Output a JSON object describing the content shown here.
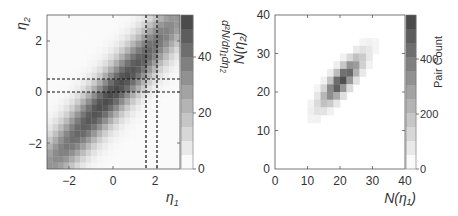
{
  "chart_data": [
    {
      "type": "heatmap",
      "title": "",
      "xlabel": "η1",
      "ylabel": "η2",
      "xlim": [
        -3,
        3
      ],
      "ylim": [
        -3,
        3
      ],
      "xticks": [
        -2,
        0,
        2
      ],
      "yticks": [
        -2,
        0,
        2
      ],
      "grid": false,
      "description": "Diagonal band of high density along η2 ≈ η1, darkest near center, fading away from the diagonal.",
      "reference_lines": {
        "vertical": [
          1.5,
          2.0
        ],
        "horizontal": [
          0.0,
          0.5
        ],
        "style": "dashed"
      },
      "colorbar": {
        "label": "d²N/dη1dη2",
        "range": [
          0,
          55
        ],
        "ticks": [
          0,
          20,
          40
        ]
      }
    },
    {
      "type": "heatmap",
      "title": "",
      "xlabel": "N(η1)",
      "ylabel": "N(η2)",
      "xlim": [
        0,
        40
      ],
      "ylim": [
        0,
        40
      ],
      "xticks": [
        0,
        10,
        20,
        30,
        40
      ],
      "yticks": [
        0,
        10,
        20,
        30,
        40
      ],
      "grid": false,
      "description": "Correlated 2D histogram concentrated along diagonal, peak near N(η1)≈20, N(η2)≈23.",
      "colorbar": {
        "label": "Pair Count",
        "range": [
          0,
          560
        ],
        "ticks": [
          0,
          200,
          400
        ]
      }
    }
  ],
  "left": {
    "xlabel_main": "η",
    "xlabel_sub": "1",
    "ylabel_main": "η",
    "ylabel_sub": "2",
    "xticks": [
      "−2",
      "0",
      "2"
    ],
    "yticks": [
      "2",
      "0",
      "−2"
    ],
    "cbar_ticks": [
      "40",
      "20",
      "0"
    ],
    "cbar_label": "d²N/dη₁dη₂"
  },
  "right": {
    "xlabel": "N(η₁)",
    "ylabel": "N(η₂)",
    "xticks": [
      "0",
      "10",
      "20",
      "30",
      "40"
    ],
    "yticks": [
      "40",
      "30",
      "20",
      "10",
      "0"
    ],
    "cbar_ticks": [
      "400",
      "200",
      "0"
    ],
    "cbar_label": "Pair Count"
  }
}
